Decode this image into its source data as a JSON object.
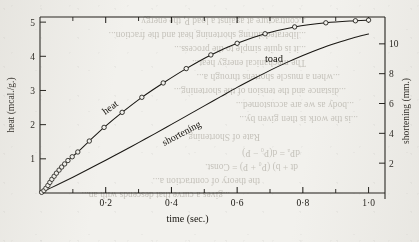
{
  "figure": {
    "name": "heat-and-shortening-vs-time",
    "specimen_label": "toad"
  },
  "bleed_through": [
    {
      "text": "...contracture at against a load P, the energy",
      "x": 196,
      "y": 24
    },
    {
      "text": "...liberated during shortening heat and the fraction...",
      "x": 196,
      "y": 38
    },
    {
      "text": "...it is quite simple to the process...",
      "x": 196,
      "y": 52
    },
    {
      "text": "The mechanical energy heat...",
      "x": 196,
      "y": 66
    },
    {
      "text": "...when a muscle shortens through a...",
      "x": 230,
      "y": 80
    },
    {
      "text": "...distance and the tension of the shortening...",
      "x": 236,
      "y": 94
    },
    {
      "text": "...body as we are accustomed...",
      "x": 244,
      "y": 108
    },
    {
      "text": "...is the work is then given by...",
      "x": 248,
      "y": 122
    },
    {
      "text": "Rate of Shortening",
      "x": 150,
      "y": 140
    },
    {
      "text": "dPₐ = d(P₀ − P)",
      "x": 190,
      "y": 156
    },
    {
      "text": "dt + b) (P₀ + P) = Const.",
      "x": 188,
      "y": 170
    },
    {
      "text": "the theory of contraction a...",
      "x": 150,
      "y": 184
    },
    {
      "text": "...gives a curve that descends with an...",
      "x": 120,
      "y": 198
    }
  ],
  "chart_data": {
    "type": "line",
    "title": "",
    "specimen": "toad",
    "xlabel": "time (sec.)",
    "xlim": [
      0,
      1.05
    ],
    "x_ticks": [
      0.2,
      0.4,
      0.6,
      0.8,
      1.0
    ],
    "x_tick_labels": [
      "0·2",
      "0·4",
      "0·6",
      "0·8",
      "1·0"
    ],
    "x_minor_ticks": [
      0.1,
      0.3,
      0.5,
      0.7,
      0.9
    ],
    "left_axis": {
      "label": "heat (mcal./g.)",
      "lim": [
        0,
        5.15
      ],
      "ticks": [
        1,
        2,
        3,
        4,
        5
      ],
      "tick_labels": [
        "1",
        "2",
        "3",
        "4",
        "5"
      ]
    },
    "right_axis": {
      "label": "shortening (mm.)",
      "lim": [
        0,
        11.8
      ],
      "ticks": [
        2,
        4,
        6,
        8,
        10
      ],
      "tick_labels": [
        "2",
        "4",
        "6",
        "8",
        "10"
      ]
    },
    "series": [
      {
        "name": "heat",
        "axis": "left",
        "marker": "open-circle",
        "label_text": "heat",
        "points": [
          {
            "x": 0.005,
            "y": 0.02
          },
          {
            "x": 0.012,
            "y": 0.07
          },
          {
            "x": 0.018,
            "y": 0.14
          },
          {
            "x": 0.024,
            "y": 0.22
          },
          {
            "x": 0.03,
            "y": 0.31
          },
          {
            "x": 0.036,
            "y": 0.4
          },
          {
            "x": 0.043,
            "y": 0.49
          },
          {
            "x": 0.05,
            "y": 0.58
          },
          {
            "x": 0.058,
            "y": 0.67
          },
          {
            "x": 0.066,
            "y": 0.76
          },
          {
            "x": 0.075,
            "y": 0.85
          },
          {
            "x": 0.085,
            "y": 0.95
          },
          {
            "x": 0.098,
            "y": 1.06
          },
          {
            "x": 0.115,
            "y": 1.2
          },
          {
            "x": 0.15,
            "y": 1.52
          },
          {
            "x": 0.195,
            "y": 1.92
          },
          {
            "x": 0.25,
            "y": 2.36
          },
          {
            "x": 0.31,
            "y": 2.8
          },
          {
            "x": 0.375,
            "y": 3.22
          },
          {
            "x": 0.445,
            "y": 3.64
          },
          {
            "x": 0.52,
            "y": 4.04
          },
          {
            "x": 0.6,
            "y": 4.38
          },
          {
            "x": 0.685,
            "y": 4.66
          },
          {
            "x": 0.775,
            "y": 4.86
          },
          {
            "x": 0.87,
            "y": 4.98
          },
          {
            "x": 0.96,
            "y": 5.04
          },
          {
            "x": 1.0,
            "y": 5.06
          }
        ]
      },
      {
        "name": "shortening",
        "axis": "right",
        "marker": "none",
        "label_text": "shortening",
        "points": [
          {
            "x": 0.0,
            "y": 0.0
          },
          {
            "x": 0.05,
            "y": 0.52
          },
          {
            "x": 0.1,
            "y": 1.06
          },
          {
            "x": 0.15,
            "y": 1.62
          },
          {
            "x": 0.2,
            "y": 2.2
          },
          {
            "x": 0.25,
            "y": 2.78
          },
          {
            "x": 0.3,
            "y": 3.38
          },
          {
            "x": 0.35,
            "y": 3.98
          },
          {
            "x": 0.4,
            "y": 4.6
          },
          {
            "x": 0.45,
            "y": 5.22
          },
          {
            "x": 0.5,
            "y": 5.84
          },
          {
            "x": 0.55,
            "y": 6.46
          },
          {
            "x": 0.6,
            "y": 7.08
          },
          {
            "x": 0.65,
            "y": 7.66
          },
          {
            "x": 0.7,
            "y": 8.22
          },
          {
            "x": 0.75,
            "y": 8.74
          },
          {
            "x": 0.8,
            "y": 9.22
          },
          {
            "x": 0.85,
            "y": 9.66
          },
          {
            "x": 0.9,
            "y": 10.04
          },
          {
            "x": 0.95,
            "y": 10.38
          },
          {
            "x": 1.0,
            "y": 10.66
          }
        ]
      }
    ],
    "grid": false,
    "legend": "none"
  }
}
